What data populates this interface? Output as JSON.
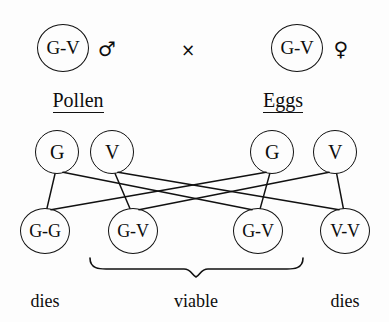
{
  "diagram": {
    "type": "genetic-cross",
    "parents": [
      {
        "genotype": "G-V",
        "sex_symbol": "♂",
        "sex": "male",
        "cx": 63,
        "cy": 48
      },
      {
        "genotype": "G-V",
        "sex_symbol": "♀",
        "sex": "female",
        "cx": 297,
        "cy": 48
      }
    ],
    "cross_symbol": "×",
    "cross_x": 188,
    "cross_y": 50,
    "group_labels": [
      {
        "text": "Pollen",
        "cx": 78,
        "cy": 101
      },
      {
        "text": "Eggs",
        "cx": 283,
        "cy": 101
      }
    ],
    "gametes": [
      {
        "allele": "G",
        "parent": "male",
        "cx": 57,
        "cy": 152
      },
      {
        "allele": "V",
        "parent": "male",
        "cx": 112,
        "cy": 152
      },
      {
        "allele": "G",
        "parent": "female",
        "cx": 272,
        "cy": 152
      },
      {
        "allele": "V",
        "parent": "female",
        "cx": 335,
        "cy": 152
      }
    ],
    "offspring": [
      {
        "genotype": "G-G",
        "cx": 45,
        "cy": 231,
        "fate": "dies"
      },
      {
        "genotype": "G-V",
        "cx": 133,
        "cy": 231,
        "fate": "viable"
      },
      {
        "genotype": "G-V",
        "cx": 258,
        "cy": 231,
        "fate": "viable"
      },
      {
        "genotype": "V-V",
        "cx": 345,
        "cy": 231,
        "fate": "dies"
      }
    ],
    "fusion_lines": [
      {
        "from_gamete": 0,
        "to_offspring": 0
      },
      {
        "from_gamete": 0,
        "to_offspring": 2
      },
      {
        "from_gamete": 1,
        "to_offspring": 1
      },
      {
        "from_gamete": 1,
        "to_offspring": 3
      },
      {
        "from_gamete": 2,
        "to_offspring": 0
      },
      {
        "from_gamete": 2,
        "to_offspring": 2
      },
      {
        "from_gamete": 3,
        "to_offspring": 1
      },
      {
        "from_gamete": 3,
        "to_offspring": 3
      }
    ],
    "brace": {
      "left_x": 90,
      "right_x": 303,
      "top_y": 258,
      "depth_y": 275,
      "tip_x": 196
    },
    "fate_labels": [
      {
        "text": "dies",
        "cx": 45,
        "cy": 302
      },
      {
        "text": "viable",
        "cx": 196,
        "cy": 302
      },
      {
        "text": "dies",
        "cx": 345,
        "cy": 302
      }
    ],
    "stroke_color": "#111111",
    "background_color": "#fdfdfd"
  }
}
